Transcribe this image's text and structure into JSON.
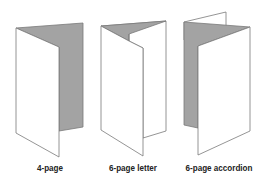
{
  "colors": {
    "panel_fill": "#ffffff",
    "shaded_fill": "#a3a3a3",
    "stroke": "#7a7a7a",
    "label": "#222222"
  },
  "figures": [
    {
      "id": "4-page",
      "label": "4-page",
      "label_center_x": 50
    },
    {
      "id": "6-page-letter",
      "label": "6-page letter",
      "label_center_x": 133
    },
    {
      "id": "6-page-accordion",
      "label": "6-page accordion",
      "label_center_x": 219
    }
  ]
}
